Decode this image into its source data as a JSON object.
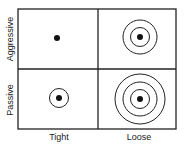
{
  "diagram": {
    "y_axis": {
      "top_label": "Aggressive",
      "bottom_label": "Passive"
    },
    "x_axis": {
      "left_label": "Tight",
      "right_label": "Loose"
    },
    "quadrants": [
      {
        "id": "aggressive-tight",
        "rings": 0
      },
      {
        "id": "aggressive-loose",
        "rings": 2
      },
      {
        "id": "passive-tight",
        "rings": 1
      },
      {
        "id": "passive-loose",
        "rings": 3
      }
    ],
    "colors": {
      "line": "#222222",
      "dot": "#111111",
      "background": "#ffffff"
    }
  }
}
